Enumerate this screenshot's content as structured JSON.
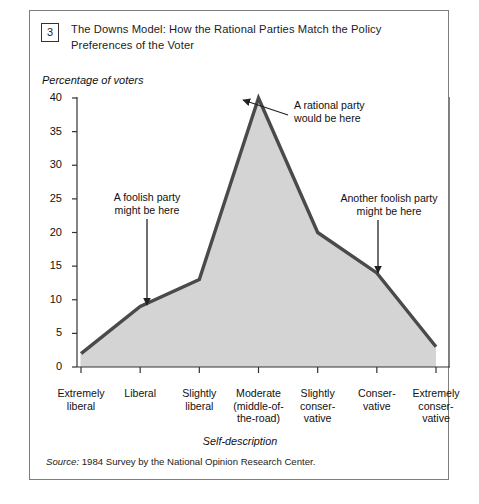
{
  "figure": {
    "number": "3",
    "title": "The Downs Model: How the Rational Parties Match the Policy Preferences of the Voter",
    "source_prefix": "Source:",
    "source_text": " 1984 Survey by the National Opinion Research Center."
  },
  "chart_data": {
    "type": "area",
    "title": "The Downs Model: How the Rational Parties Match the Policy Preferences of the Voter",
    "xlabel": "Self-description",
    "ylabel": "Percentage of voters",
    "categories": [
      "Extremely liberal",
      "Liberal",
      "Slightly liberal",
      "Moderate (middle-of-the-road)",
      "Slightly conservative",
      "Conservative",
      "Extremely conservative"
    ],
    "category_lines": [
      [
        "Extremely",
        "liberal"
      ],
      [
        "Liberal"
      ],
      [
        "Slightly",
        "liberal"
      ],
      [
        "Moderate",
        "(middle-of-",
        "the-road)"
      ],
      [
        "Slightly",
        "conser-",
        "vative"
      ],
      [
        "Conser-",
        "vative"
      ],
      [
        "Extremely",
        "conser-",
        "vative"
      ]
    ],
    "values": [
      2,
      9,
      13,
      40,
      20,
      14,
      3
    ],
    "ylim": [
      0,
      40
    ],
    "yticks": [
      0,
      5,
      10,
      15,
      20,
      25,
      30,
      35,
      40
    ],
    "grid": false,
    "legend": "none",
    "line_color": "#4a4a4a",
    "fill_color": "#d4d4d4",
    "annotations": [
      {
        "id": "foolish-left",
        "lines": [
          "A foolish party",
          "might be here"
        ],
        "points_to_category": "Liberal",
        "points_to_value": 9
      },
      {
        "id": "rational-peak",
        "lines": [
          "A rational party",
          "would be here"
        ],
        "points_to_category": "Moderate (middle-of-the-road)",
        "points_to_value": 40
      },
      {
        "id": "foolish-right",
        "lines": [
          "Another foolish party",
          "might be here"
        ],
        "points_to_category": "Conservative",
        "points_to_value": 14
      }
    ]
  }
}
